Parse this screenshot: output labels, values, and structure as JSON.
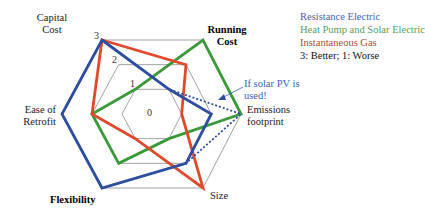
{
  "chart_data": {
    "type": "radar",
    "title": "",
    "axes": [
      "Capital Cost",
      "Running Cost",
      "Emissions footprint",
      "Size",
      "Flexibility",
      "Ease of Retrofit"
    ],
    "axis_label_lines": [
      [
        "Capital",
        "Cost"
      ],
      [
        "Running",
        "Cost"
      ],
      [
        "Emissions",
        "footprint"
      ],
      [
        "Size"
      ],
      [
        "Flexibility"
      ],
      [
        "Ease of",
        "Retrofit"
      ]
    ],
    "bold_axes": [
      "Running Cost",
      "Flexibility"
    ],
    "tick_labels": [
      "0",
      "1",
      "2",
      "3"
    ],
    "range": [
      0,
      3
    ],
    "series": [
      {
        "name": "Resistance Electric",
        "color": "#2e4ea0",
        "style": "solid",
        "values": [
          3,
          1,
          2,
          2,
          3,
          3
        ]
      },
      {
        "name": "Resistance Electric (if solar PV is used)",
        "color": "#2e4ea0",
        "style": "dotted",
        "values": [
          3,
          1,
          3,
          2,
          3,
          3
        ]
      },
      {
        "name": "Heat Pump and Solar Electric",
        "color": "#3a9a3a",
        "style": "solid",
        "values": [
          1,
          3,
          3,
          1,
          2,
          2
        ]
      },
      {
        "name": "Instantaneous Gas",
        "color": "#e04a2a",
        "style": "solid",
        "values": [
          3,
          2,
          1,
          3,
          1,
          2
        ]
      }
    ],
    "annotations": [
      "If solar PV is used!"
    ],
    "note": "3: Better; 1: Worse"
  },
  "legend": {
    "items": [
      {
        "label": "Resistance Electric",
        "color": "#4a64b0"
      },
      {
        "label": "Heat Pump and Solar Electric",
        "color": "#5a9e5a"
      },
      {
        "label": "Instantaneous Gas",
        "color": "#b04a30"
      },
      {
        "label": "3: Better; 1: Worse",
        "color": "#111111"
      }
    ]
  },
  "annotation": {
    "line1": "If solar PV is",
    "line2": "used!"
  }
}
